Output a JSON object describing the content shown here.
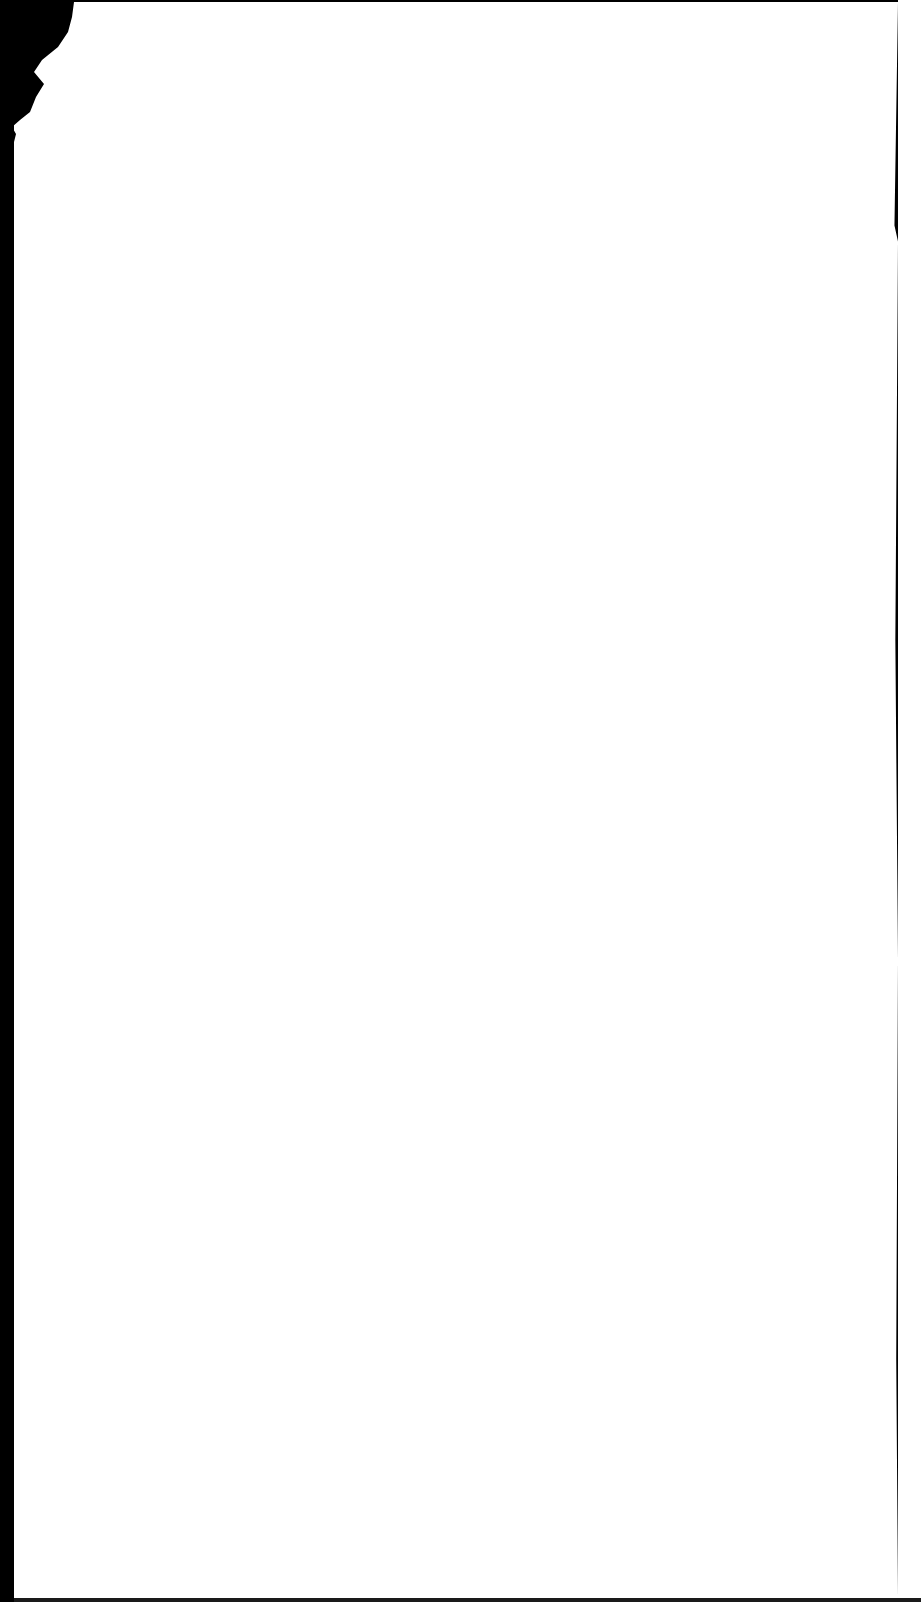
{
  "document": {
    "type": "scanned-page",
    "content": "",
    "background_color": "#000000",
    "paper_color": "#ffffff"
  }
}
